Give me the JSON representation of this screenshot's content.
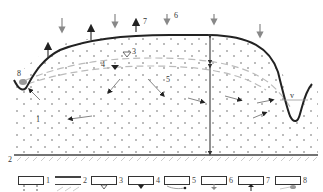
{
  "diagram": {
    "type": "hydrogeological cross-section",
    "colors": {
      "ground_surface": "#222222",
      "arrows_gray": "#888888",
      "arrows_dark": "#222222",
      "dashed_lines": "#bbbbbb",
      "dots": "#666666",
      "base": "#444444",
      "water_body": "#999999"
    },
    "labels": {
      "l1": "1",
      "l2": "2",
      "l3": "3",
      "l4": "4",
      "l5": "5",
      "l6": "6",
      "l7": "7",
      "l8": "8",
      "lv": "v"
    }
  },
  "legend": {
    "items": [
      {
        "num": "1",
        "symbol": "dotted-sediment"
      },
      {
        "num": "2",
        "symbol": "impermeable-base"
      },
      {
        "num": "3",
        "symbol": "water-table-open"
      },
      {
        "num": "4",
        "symbol": "water-table-filled"
      },
      {
        "num": "5",
        "symbol": "flow-line"
      },
      {
        "num": "6",
        "symbol": "infiltration-arrow"
      },
      {
        "num": "7",
        "symbol": "evaporation-arrow"
      },
      {
        "num": "8",
        "symbol": "discharge-zone"
      }
    ]
  }
}
